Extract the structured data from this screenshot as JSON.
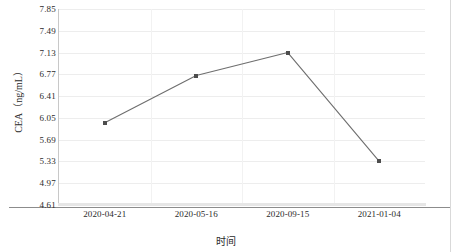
{
  "chart_data": {
    "type": "line",
    "title": "",
    "xlabel": "时间",
    "ylabel": "CEA（ng/mL）",
    "categories": [
      "2020-04-21",
      "2020-05-16",
      "2020-09-15",
      "2021-01-04"
    ],
    "values": [
      5.97,
      6.75,
      7.13,
      5.33
    ],
    "series": [
      {
        "name": "CEA",
        "values": [
          5.97,
          6.75,
          7.13,
          5.33
        ]
      }
    ],
    "ylim": [
      4.61,
      7.85
    ],
    "ytick_labels": [
      "7.85",
      "7.49",
      "7.13",
      "6.77",
      "6.41",
      "6.05",
      "5.69",
      "5.33",
      "4.97",
      "4.61"
    ],
    "ytick_values": [
      7.85,
      7.49,
      7.13,
      6.77,
      6.41,
      6.05,
      5.69,
      5.33,
      4.97,
      4.61
    ],
    "ytick_step": 0.36,
    "xtick_labels": [
      "2020-04-21",
      "2020-05-16",
      "2020-09-15",
      "2021-01-04"
    ],
    "grid": "horizontal-and-vertical",
    "legend": "none",
    "marker": "square",
    "colors": {
      "line": "#6e6e6e",
      "marker": "#4d4d4d",
      "gridline_horizontal": "#ededed",
      "gridline_vertical": "#f2f2f2",
      "axis": "#8c8c8c",
      "text": "#2b2b2b",
      "background": "#ffffff"
    }
  },
  "axis": {
    "y_title": "CEA（ng/mL）",
    "x_title": "时间"
  }
}
